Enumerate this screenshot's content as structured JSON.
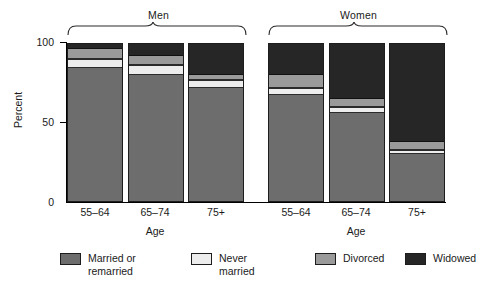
{
  "chart_data": {
    "type": "bar",
    "subtype": "stacked-100-percent",
    "title": "",
    "xlabel": "Age",
    "ylabel": "Percent",
    "ylim": [
      0,
      100
    ],
    "yticks": [
      0,
      50,
      100
    ],
    "ytick_labels": [
      "0",
      "50",
      "100"
    ],
    "grid": false,
    "legend_position": "bottom",
    "groups": [
      "Men",
      "Women"
    ],
    "categories": [
      "55–64",
      "65–74",
      "75+",
      "55–64",
      "65–74",
      "75+"
    ],
    "series": [
      {
        "name": "Married or remarried",
        "color": "#6d6d6d",
        "values": [
          84,
          80,
          72,
          67,
          56,
          30
        ]
      },
      {
        "name": "Never married",
        "color": "#ededed",
        "values": [
          6,
          6,
          5,
          5,
          4,
          3
        ]
      },
      {
        "name": "Divorced",
        "color": "#9a9a9a",
        "values": [
          6,
          6,
          3,
          8,
          5,
          5
        ]
      },
      {
        "name": "Widowed",
        "color": "#262626",
        "values": [
          4,
          8,
          20,
          20,
          35,
          62
        ]
      }
    ],
    "bars": [
      {
        "group": "Men",
        "age": "55–64",
        "married": 84,
        "never": 6,
        "divorced": 6,
        "widowed": 4
      },
      {
        "group": "Men",
        "age": "65–74",
        "married": 80,
        "never": 6,
        "divorced": 6,
        "widowed": 8
      },
      {
        "group": "Men",
        "age": "75+",
        "married": 72,
        "never": 5,
        "divorced": 3,
        "widowed": 20
      },
      {
        "group": "Women",
        "age": "55–64",
        "married": 67,
        "never": 5,
        "divorced": 8,
        "widowed": 20
      },
      {
        "group": "Women",
        "age": "65–74",
        "married": 56,
        "never": 4,
        "divorced": 5,
        "widowed": 35
      },
      {
        "group": "Women",
        "age": "75+",
        "married": 30,
        "never": 3,
        "divorced": 5,
        "widowed": 62
      }
    ]
  },
  "axes": {
    "y_title": "Percent",
    "y_labels": {
      "top": "100",
      "mid": "50",
      "bottom": "0"
    },
    "x_title_men": "Age",
    "x_title_women": "Age",
    "x_labels": {
      "men_1": "55–64",
      "men_2": "65–74",
      "men_3": "75+",
      "women_1": "55–64",
      "women_2": "65–74",
      "women_3": "75+"
    }
  },
  "groups": {
    "men_label": "Men",
    "women_label": "Women"
  },
  "legend": {
    "items": [
      {
        "label": "Married or\nremarried",
        "color": "#6d6d6d",
        "key": "married"
      },
      {
        "label": "Never\nmarried",
        "color": "#ededed",
        "key": "never"
      },
      {
        "label": "Divorced",
        "color": "#9a9a9a",
        "key": "divorced"
      },
      {
        "label": "Widowed",
        "color": "#262626",
        "key": "widowed"
      }
    ]
  }
}
